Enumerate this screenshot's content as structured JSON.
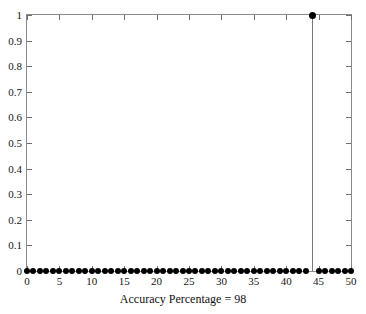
{
  "chart_data": {
    "type": "scatter",
    "title": "",
    "subtitle": "",
    "xlabel": "Accuracy Percentage = 98",
    "ylabel": "",
    "xlim": [
      0,
      50
    ],
    "ylim": [
      0,
      1
    ],
    "xticks": [
      0,
      5,
      10,
      15,
      20,
      25,
      30,
      35,
      40,
      45,
      50
    ],
    "xtick_labels": [
      "0",
      "5",
      "10",
      "15",
      "20",
      "25",
      "30",
      "35",
      "40",
      "45",
      "50"
    ],
    "yticks": [
      0,
      0.1,
      0.2,
      0.3,
      0.4,
      0.5,
      0.6,
      0.7,
      0.8,
      0.9,
      1
    ],
    "ytick_labels": [
      "0",
      "0.1",
      "0.2",
      "0.3",
      "0.4",
      "0.5",
      "0.6",
      "0.7",
      "0.8",
      "0.9",
      "1"
    ],
    "grid": false,
    "legend": null,
    "marker_style": "filled-circle",
    "marker_color": "#000000",
    "stem_color": "#7a7a7a",
    "axis_color": "#8a8a8a",
    "background_color": "#ffffff",
    "x": [
      0,
      1,
      2,
      3,
      4,
      5,
      6,
      7,
      8,
      9,
      10,
      11,
      12,
      13,
      14,
      15,
      16,
      17,
      18,
      19,
      20,
      21,
      22,
      23,
      24,
      25,
      26,
      27,
      28,
      29,
      30,
      31,
      32,
      33,
      34,
      35,
      36,
      37,
      38,
      39,
      40,
      41,
      42,
      43,
      44,
      45,
      46,
      47,
      48,
      49,
      50
    ],
    "values": [
      0,
      0,
      0,
      0,
      0,
      0,
      0,
      0,
      0,
      0,
      0,
      0,
      0,
      0,
      0,
      0,
      0,
      0,
      0,
      0,
      0,
      0,
      0,
      0,
      0,
      0,
      0,
      0,
      0,
      0,
      0,
      0,
      0,
      0,
      0,
      0,
      0,
      0,
      0,
      0,
      0,
      0,
      0,
      0,
      1,
      0,
      0,
      0,
      0,
      0,
      0
    ],
    "peak": {
      "x": 44,
      "y": 1
    },
    "annotation": "Accuracy Percentage = 98"
  },
  "figure": {
    "top_residue_text": ""
  }
}
